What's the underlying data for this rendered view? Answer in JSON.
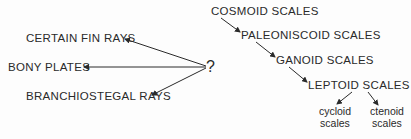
{
  "diagram": {
    "left_branch": {
      "source": "?",
      "targets": [
        {
          "label": "CERTAIN FIN RAYS"
        },
        {
          "label": "BONY PLATES"
        },
        {
          "label": "BRANCHIOSTEGAL RAYS"
        }
      ]
    },
    "sequence": [
      {
        "label": "COSMOID SCALES"
      },
      {
        "label": "PALEONISCOID SCALES"
      },
      {
        "label": "GANOID SCALES"
      },
      {
        "label": "LEPTOID SCALES"
      }
    ],
    "leptoid_children": [
      {
        "line1": "cycloid",
        "line2": "scales"
      },
      {
        "line1": "ctenoid",
        "line2": "scales"
      }
    ],
    "colors": {
      "ink": "#2a2a2a",
      "background": "#fdfdfd"
    }
  }
}
